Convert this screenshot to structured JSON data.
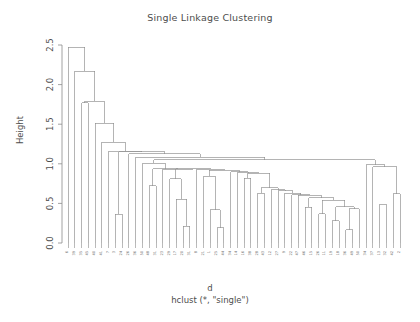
{
  "chart_data": {
    "type": "line",
    "subtype": "dendrogram",
    "title": "Single Linkage Clustering",
    "xlabel": "d",
    "xlabel_sub": "hclust (*, \"single\")",
    "ylabel": "Height",
    "ylim": [
      0.0,
      2.5
    ],
    "yticks": [
      "0.0",
      "0.5",
      "1.0",
      "1.5",
      "2.0",
      "2.5"
    ],
    "ytick_values": [
      0.0,
      0.5,
      1.0,
      1.5,
      2.0,
      2.5
    ],
    "grid": false,
    "legend": false,
    "linkage_method": "single",
    "n_leaves": 50,
    "line_color": "#8c8c8c",
    "background": "#ffffff",
    "leaf_order": [
      "6",
      "39",
      "35",
      "45",
      "40",
      "41",
      "7",
      "3",
      "24",
      "26",
      "36",
      "50",
      "48",
      "31",
      "23",
      "29",
      "7",
      "17",
      "20",
      "31",
      "8",
      "21",
      "1",
      "25",
      "44",
      "34",
      "14",
      "16",
      "38",
      "28",
      "28",
      "43",
      "12",
      "27",
      "9",
      "22",
      "47",
      "12",
      "46",
      "15",
      "26",
      "11",
      "15",
      "19",
      "18",
      "36",
      "49",
      "50",
      "34",
      "37",
      "13",
      "32",
      "42",
      "2",
      "4",
      "40"
    ],
    "leaf_labels": [
      "6",
      "39",
      "35",
      "45",
      "40",
      "41",
      "7",
      "3",
      "24",
      "26",
      "36",
      "50",
      "48",
      "31",
      "23",
      "29",
      "17",
      "20",
      "31",
      "8",
      "21",
      "1",
      "25",
      "44",
      "34",
      "14",
      "16",
      "38",
      "28",
      "43",
      "12",
      "27",
      "9",
      "22",
      "47",
      "46",
      "15",
      "26",
      "11",
      "19",
      "18",
      "36",
      "49",
      "50",
      "34",
      "37",
      "13",
      "32",
      "42",
      "2"
    ],
    "merge_heights": [
      2.47,
      2.17,
      1.79,
      1.77,
      1.51,
      1.27,
      1.16,
      1.15,
      1.13,
      1.08,
      1.05,
      1.01,
      0.99,
      0.96,
      0.94,
      0.93,
      0.92,
      0.9,
      0.89,
      0.88,
      0.84,
      0.82,
      0.81,
      0.72,
      0.7,
      0.67,
      0.66,
      0.64,
      0.63,
      0.62,
      0.61,
      0.6,
      0.58,
      0.57,
      0.55,
      0.54,
      0.53,
      0.49,
      0.46,
      0.45,
      0.43,
      0.42,
      0.37,
      0.36,
      0.28,
      0.21,
      0.19,
      0.18,
      0.17,
      0.16
    ],
    "max_height": 2.47,
    "min_merge_height": 0.16
  }
}
